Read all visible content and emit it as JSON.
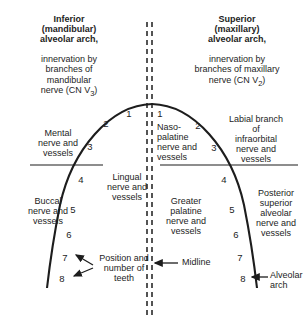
{
  "figure": {
    "type": "anatomical-diagram",
    "background": "#ffffff",
    "line_color": "#1d1d1d"
  },
  "titles": {
    "left": "Inferior\n(mandibular)\nalveolar arch,",
    "left_sub": "innervation by\nbranches of\nmandibular\nnerve (CN V",
    "left_subscript": "3",
    "left_close": ")",
    "right": "Superior\n(maxillary)\nalveolar arch,",
    "right_sub": "innervation by\nbranches of maxillary\nnerve (CN V",
    "right_subscript": "2",
    "right_close": ")"
  },
  "labels": {
    "mental": "Mental\nnerve and\nvessels",
    "buccal": "Buccal\nnerve and\nvessels",
    "lingual": "Lingual\nnerve and\nvessels",
    "nasopalatine": "Naso-\npalatine\nnerve and\nvessels",
    "greater_palatine": "Greater\npalatine\nnerve and\nvessels",
    "labial_infraorbital": "Labial branch\nof\ninfraorbital\nnerve and\nvessels",
    "posterior_superior_alveolar": "Posterior\nsuperior\nalveolar\nnerve and\nvessels",
    "position_number_teeth": "Position and\nnumber of\nteeth",
    "midline": "Midline",
    "alveolar_arch": "Alveolar\narch"
  },
  "tooth_numbers": {
    "left_arch": [
      "1",
      "2",
      "3",
      "4",
      "5",
      "6",
      "7",
      "8"
    ],
    "right_arch": [
      "1",
      "2",
      "3",
      "4",
      "5",
      "6",
      "7",
      "8"
    ]
  }
}
